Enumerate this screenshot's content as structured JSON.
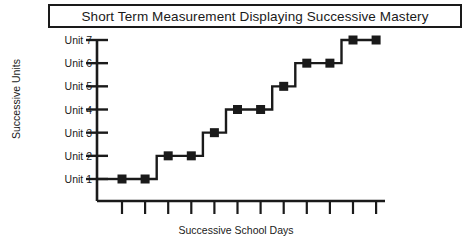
{
  "title": {
    "text": "Short Term Measurement Displaying Successive Mastery"
  },
  "chart_data": {
    "type": "line",
    "title": "Short Term Measurement Displaying Successive Mastery",
    "subtitle": "",
    "xlabel": "Successive School Days",
    "ylabel": "Successive Units",
    "step": "post",
    "grid": false,
    "legend": null,
    "marker": "square",
    "marker_color": "#1a1a1a",
    "line_color": "#1a1a1a",
    "x": [
      1,
      2,
      3,
      4,
      5,
      6,
      7,
      8,
      9,
      10,
      11,
      12
    ],
    "values": [
      1,
      1,
      2,
      2,
      3,
      4,
      4,
      5,
      6,
      6,
      7,
      7
    ],
    "xlim": [
      0,
      13
    ],
    "ylim": [
      0.4,
      7.6
    ],
    "x_tick_labels": [
      "",
      "",
      "",
      "",
      "",
      "",
      "",
      "",
      "",
      "",
      "",
      ""
    ],
    "y_tick_labels": [
      "Unit 1",
      "Unit 2",
      "Unit 3",
      "Unit 4",
      "Unit 5",
      "Unit 6",
      "Unit 7"
    ],
    "y_tick_values": [
      1,
      2,
      3,
      4,
      5,
      6,
      7
    ],
    "annotations": []
  },
  "axes": {
    "y_labels": [
      "Unit 7",
      "Unit 6",
      "Unit 5",
      "Unit 4",
      "Unit 3",
      "Unit 2",
      "Unit 1"
    ],
    "x_title": "Successive School Days",
    "y_title": "Successive Units"
  },
  "colors": {
    "ink": "#1a1a1a",
    "background": "#ffffff"
  }
}
